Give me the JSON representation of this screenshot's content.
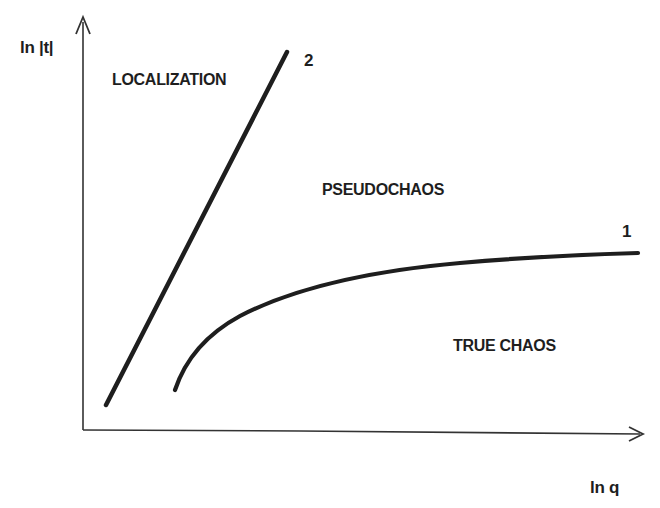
{
  "diagram": {
    "title": "",
    "axes": {
      "y_label": "ln |t|",
      "x_label": "ln q"
    },
    "curves": [
      {
        "id": "1",
        "label": "1",
        "shape": "concave rising curve, saturating toward the right",
        "separates": [
          "PSEUDOCHAOS",
          "TRUE CHAOS"
        ]
      },
      {
        "id": "2",
        "label": "2",
        "shape": "straight steep line",
        "separates": [
          "LOCALIZATION",
          "PSEUDOCHAOS"
        ]
      }
    ],
    "regions": {
      "localization": "LOCALIZATION",
      "pseudochaos": "PSEUDOCHAOS",
      "true_chaos": "TRUE CHAOS"
    },
    "colors": {
      "ink": "#1e1e1e",
      "axis": "#333333",
      "background": "#ffffff"
    }
  }
}
